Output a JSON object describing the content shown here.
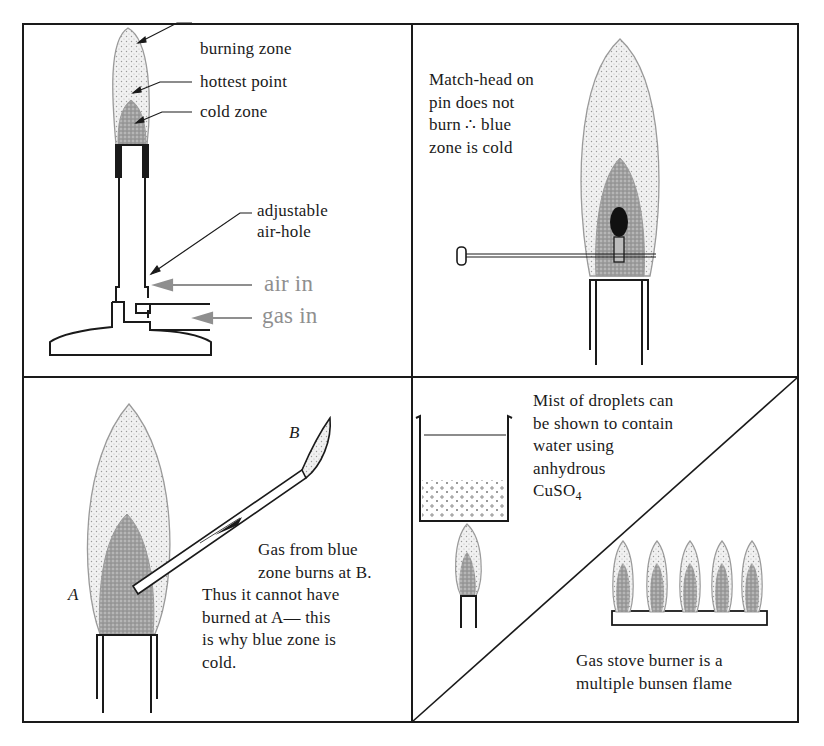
{
  "figure": {
    "panels": [
      {
        "id": "bunsen-burner",
        "labels": {
          "burning_zone": "burning zone",
          "hottest_point": "hottest point",
          "cold_zone": "cold zone",
          "air_hole_line1": "adjustable",
          "air_hole_line2": "air-hole",
          "air_in": "air in",
          "gas_in": "gas in"
        }
      },
      {
        "id": "match-head",
        "caption_lines": [
          "Match-head on",
          "pin does not",
          "burn ∴ blue",
          "zone is cold"
        ]
      },
      {
        "id": "tube-experiment",
        "point_a": "A",
        "point_b": "B",
        "caption_lines": [
          "Gas from blue",
          "zone burns at B.",
          "Thus it cannot have",
          "burned at A— this",
          "is why blue zone is",
          "cold."
        ]
      },
      {
        "id": "beaker-and-stove",
        "beaker_caption_lines": [
          "Mist of droplets can",
          "be shown to contain",
          "water using",
          "anhydrous"
        ],
        "formula_main": "CuSO",
        "formula_sub": "4",
        "stove_caption_lines": [
          "Gas stove burner is a",
          "multiple bunsen flame"
        ]
      }
    ],
    "colors": {
      "ink": "#1a1a1a",
      "outer_flame_fill": "#ececec",
      "inner_flame_fill": "#a9a9a9",
      "flame_outline": "#9a9a9a",
      "arrow_gray": "#8f8f8f"
    }
  }
}
